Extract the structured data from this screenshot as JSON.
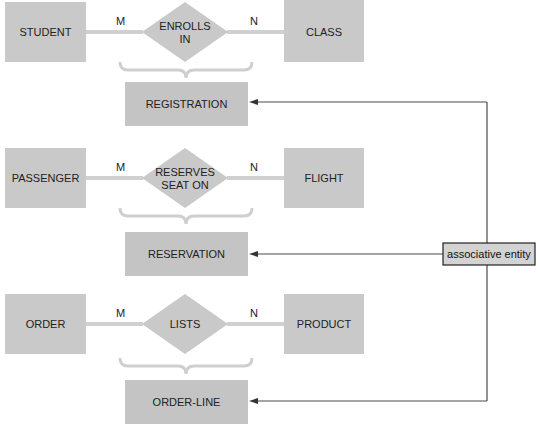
{
  "diagram": {
    "rows": [
      {
        "left_entity": "STUDENT",
        "relationship_line1": "ENROLLS",
        "relationship_line2": "IN",
        "right_entity": "CLASS",
        "left_cardinality": "M",
        "right_cardinality": "N",
        "associative_entity": "REGISTRATION"
      },
      {
        "left_entity": "PASSENGER",
        "relationship_line1": "RESERVES",
        "relationship_line2": "SEAT ON",
        "right_entity": "FLIGHT",
        "left_cardinality": "M",
        "right_cardinality": "N",
        "associative_entity": "RESERVATION"
      },
      {
        "left_entity": "ORDER",
        "relationship_line1": "LISTS",
        "relationship_line2": "",
        "right_entity": "PRODUCT",
        "left_cardinality": "M",
        "right_cardinality": "N",
        "associative_entity": "ORDER-LINE"
      }
    ],
    "callout": {
      "label": "associative entity"
    }
  },
  "colors": {
    "entity_fill": "#c9c9c9",
    "connector": "#d0d0d0",
    "arrow": "#333333",
    "callout_fill": "#d3d3d3"
  }
}
